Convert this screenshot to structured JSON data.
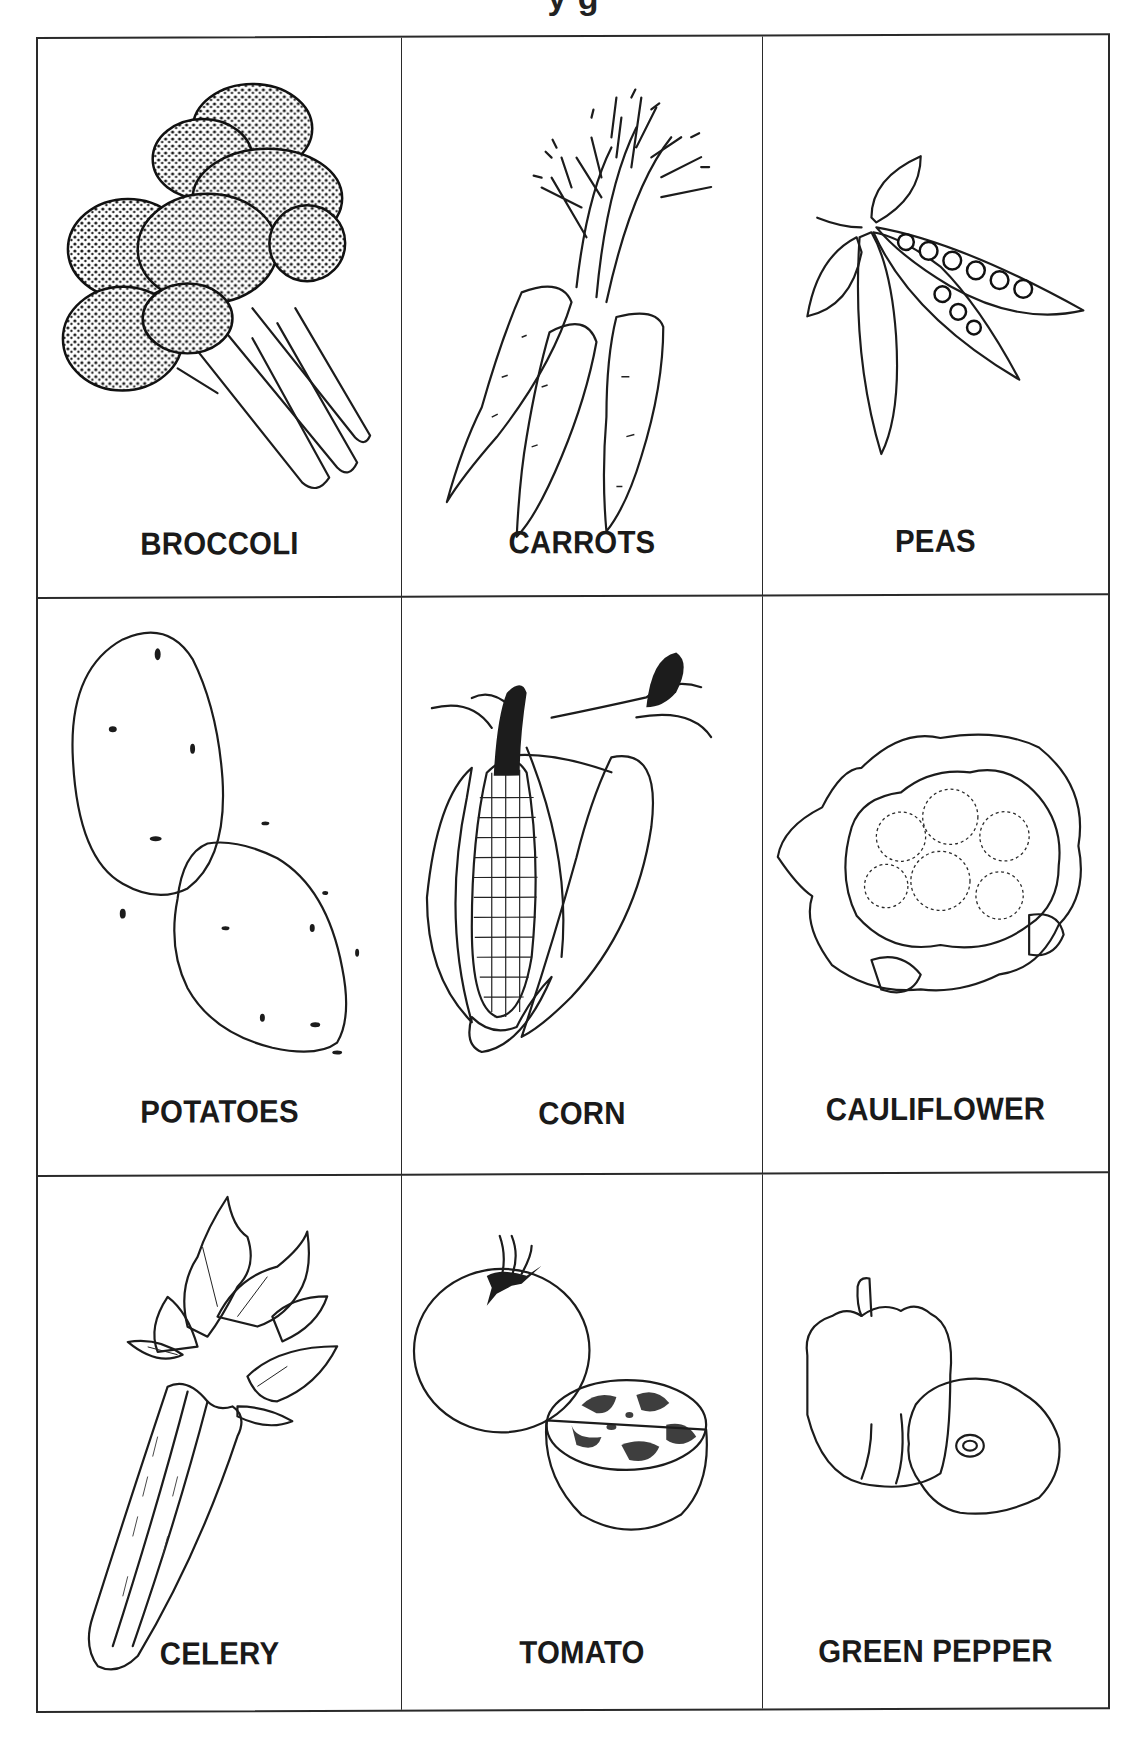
{
  "page": {
    "title_fragment": "y  g",
    "title_note": "Title is cropped at top edge; only descenders visible"
  },
  "grid": {
    "rows": 3,
    "columns": 3,
    "border_color": "#2a2a2a",
    "cells": [
      {
        "label": "BROCCOLI",
        "icon": "broccoli-illustration"
      },
      {
        "label": "CARROTS",
        "icon": "carrots-illustration"
      },
      {
        "label": "PEAS",
        "icon": "peas-illustration"
      },
      {
        "label": "POTATOES",
        "icon": "potatoes-illustration"
      },
      {
        "label": "CORN",
        "icon": "corn-illustration"
      },
      {
        "label": "CAULIFLOWER",
        "icon": "cauliflower-illustration"
      },
      {
        "label": "CELERY",
        "icon": "celery-illustration"
      },
      {
        "label": "TOMATO",
        "icon": "tomato-illustration"
      },
      {
        "label": "GREEN PEPPER",
        "icon": "green-pepper-illustration"
      }
    ]
  }
}
